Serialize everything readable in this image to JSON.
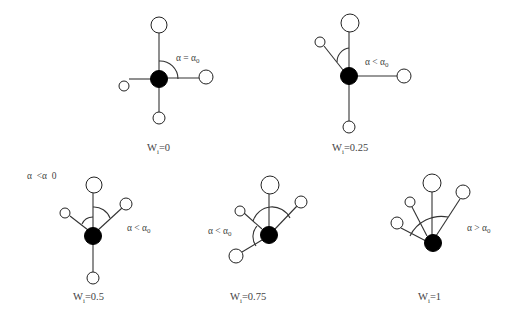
{
  "figure": {
    "annotation_top_left": "α  <α  0",
    "panels": [
      {
        "id": "w0",
        "weight_label": "W",
        "weight_sub": "i",
        "weight_value": "=0",
        "angle_label": "α = α",
        "angle_sub": "0"
      },
      {
        "id": "w025",
        "weight_label": "W",
        "weight_sub": "i",
        "weight_value": "=0.25",
        "angle_label": "α < α",
        "angle_sub": "0"
      },
      {
        "id": "w05",
        "weight_label": "W",
        "weight_sub": "i",
        "weight_value": "=0.5",
        "angle_label": "α < α",
        "angle_sub": "0"
      },
      {
        "id": "w075",
        "weight_label": "W",
        "weight_sub": "i",
        "weight_value": "=0.75",
        "angle_label": "α < α",
        "angle_sub": "0"
      },
      {
        "id": "w1",
        "weight_label": "W",
        "weight_sub": "i",
        "weight_value": "=1",
        "angle_label": "α > α",
        "angle_sub": "0"
      }
    ]
  }
}
